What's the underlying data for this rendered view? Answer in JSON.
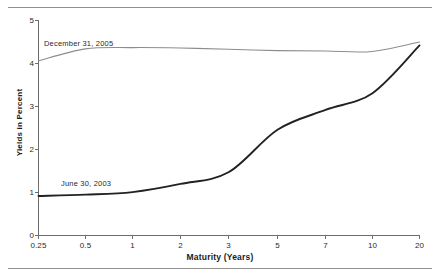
{
  "figure": {
    "y_axis_title": "Yields in Percent",
    "x_axis_title": "Maturity (Years)"
  },
  "chart_data": {
    "type": "line",
    "title": "",
    "subtitle": "",
    "xlabel": "Maturity (Years)",
    "ylabel": "Yields in Percent",
    "x_scale": "ordinal-log-like",
    "x_tick_labels": [
      "0.25",
      "0.5",
      "1",
      "2",
      "3",
      "5",
      "7",
      "10",
      "20"
    ],
    "x": [
      0.25,
      0.5,
      1,
      2,
      3,
      5,
      7,
      10,
      20
    ],
    "y_tick_labels": [
      "0",
      "1",
      "2",
      "3",
      "4",
      "5"
    ],
    "ylim": [
      0,
      5
    ],
    "grid": false,
    "legend_position": "inline-annotation",
    "series": [
      {
        "name": "December 31, 2005",
        "color": "#8d8d8d",
        "values": [
          4.06,
          4.34,
          4.37,
          4.36,
          4.33,
          4.3,
          4.29,
          4.28,
          4.5
        ]
      },
      {
        "name": "June 30, 2003",
        "color": "#222222",
        "values": [
          0.92,
          0.95,
          1.01,
          1.2,
          1.47,
          2.46,
          2.92,
          3.31,
          4.42
        ]
      }
    ],
    "annotations": [
      {
        "text": "December 31, 2005",
        "series": "December 31, 2005"
      },
      {
        "text": "June 30, 2003",
        "series": "June 30, 2003"
      }
    ]
  },
  "axes": {
    "y_ticks": [
      {
        "label": "5"
      },
      {
        "label": "4"
      },
      {
        "label": "3"
      },
      {
        "label": "2"
      },
      {
        "label": "1"
      },
      {
        "label": "0"
      }
    ],
    "x_ticks": [
      {
        "label": "0.25"
      },
      {
        "label": "0.5"
      },
      {
        "label": "1"
      },
      {
        "label": "2"
      },
      {
        "label": "3"
      },
      {
        "label": "5"
      },
      {
        "label": "7"
      },
      {
        "label": "10"
      },
      {
        "label": "20"
      }
    ]
  }
}
